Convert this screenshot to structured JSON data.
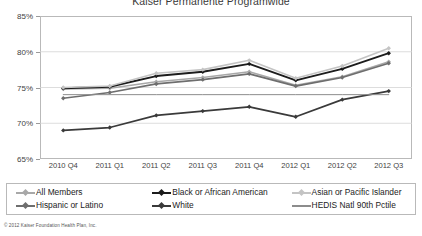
{
  "chart_data": {
    "type": "line",
    "title": "Kaiser Permanente Programwide",
    "xlabel": "",
    "ylabel": "",
    "ylim": [
      65,
      85
    ],
    "ytick_labels": [
      "85%",
      "80%",
      "75%",
      "70%",
      "65%"
    ],
    "ytick_values": [
      85,
      80,
      75,
      70,
      65
    ],
    "grid": true,
    "grid_axis": "y",
    "legend_position": "bottom",
    "legend_columns": 3,
    "categories": [
      "2010 Q4",
      "2011 Q1",
      "2011 Q2",
      "2011 Q3",
      "2011 Q4",
      "2012 Q1",
      "2012 Q2",
      "2012 Q3"
    ],
    "series": [
      {
        "name": "All Members",
        "color": "#a8a8a8",
        "marker": "diamond",
        "width": 1.6,
        "values": [
          74.8,
          74.9,
          75.8,
          76.4,
          77.2,
          75.3,
          76.5,
          78.6
        ]
      },
      {
        "name": "Black or African American",
        "color": "#1c1c1c",
        "marker": "diamond",
        "width": 1.9,
        "values": [
          74.9,
          75.1,
          76.6,
          77.2,
          78.3,
          76.0,
          77.6,
          79.8
        ]
      },
      {
        "name": "Asian or Pacific Islander",
        "color": "#c4c4c4",
        "marker": "diamond",
        "width": 1.6,
        "values": [
          75.0,
          75.2,
          77.0,
          77.5,
          78.8,
          76.3,
          78.0,
          80.5
        ]
      },
      {
        "name": "Hispanic or Latino",
        "color": "#6e6e6e",
        "marker": "diamond",
        "width": 1.7,
        "values": [
          73.5,
          74.3,
          75.5,
          76.1,
          76.9,
          75.2,
          76.4,
          78.4
        ]
      },
      {
        "name": "White",
        "color": "#3a3a3a",
        "marker": "diamond",
        "width": 1.7,
        "values": [
          69.0,
          69.4,
          71.1,
          71.7,
          72.3,
          70.9,
          73.3,
          74.5
        ]
      },
      {
        "name": "HEDIS Natl 90th Pctile",
        "color": "#8c8c8c",
        "marker": "none",
        "width": 1.0,
        "values": [
          74.0,
          74.0,
          74.0,
          74.0,
          74.0,
          74.0,
          74.0,
          74.0
        ]
      }
    ]
  },
  "legend": {
    "rows": [
      [
        "All Members",
        "Black or African American",
        "Asian or Pacific Islander"
      ],
      [
        "Hispanic or Latino",
        "White",
        "HEDIS Natl 90th Pctile"
      ]
    ]
  },
  "footer": {
    "copyright": "© 2012 Kaiser Foundation Health Plan, Inc."
  }
}
